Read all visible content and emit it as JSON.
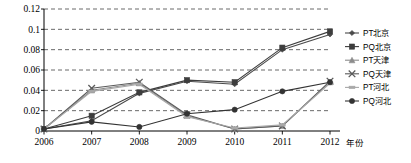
{
  "chart_data": {
    "type": "line",
    "title": "",
    "xlabel": "年份",
    "ylabel": "",
    "categories": [
      "2006",
      "2007",
      "2008",
      "2009",
      "2010",
      "2011",
      "2012"
    ],
    "ylim": [
      0,
      0.12
    ],
    "ytick_labels": [
      "0",
      "0.02",
      "0.04",
      "0.06",
      "0.08",
      "0.1",
      "0.12"
    ],
    "ytick_values": [
      0,
      0.02,
      0.04,
      0.06,
      0.08,
      0.1,
      0.12
    ],
    "grid": "horizontal-dashed",
    "legend_position": "right",
    "series": [
      {
        "name": "PT北京",
        "marker": "diamond",
        "color": "#4a4a4a",
        "values": [
          0.002,
          0.01,
          0.037,
          0.049,
          0.046,
          0.08,
          0.095
        ]
      },
      {
        "name": "PQ北京",
        "marker": "square",
        "color": "#3d3d3d",
        "values": [
          0.002,
          0.015,
          0.038,
          0.05,
          0.048,
          0.082,
          0.098
        ]
      },
      {
        "name": "PT天津",
        "marker": "triangle",
        "color": "#8c8c8c",
        "values": [
          0.002,
          0.04,
          0.047,
          0.015,
          0.002,
          0.005,
          0.048
        ]
      },
      {
        "name": "PQ天津",
        "marker": "cross",
        "color": "#5a5a5a",
        "values": [
          0.002,
          0.042,
          0.048,
          0.016,
          0.002,
          0.005,
          0.049
        ]
      },
      {
        "name": "PT河北",
        "marker": "dash",
        "color": "#a8a8a8",
        "values": [
          0.002,
          0.039,
          0.046,
          0.014,
          0.003,
          0.006,
          0.047
        ]
      },
      {
        "name": "PQ河北",
        "marker": "circle",
        "color": "#333333",
        "values": [
          0.002,
          0.009,
          0.004,
          0.017,
          0.021,
          0.039,
          0.048
        ]
      }
    ]
  }
}
